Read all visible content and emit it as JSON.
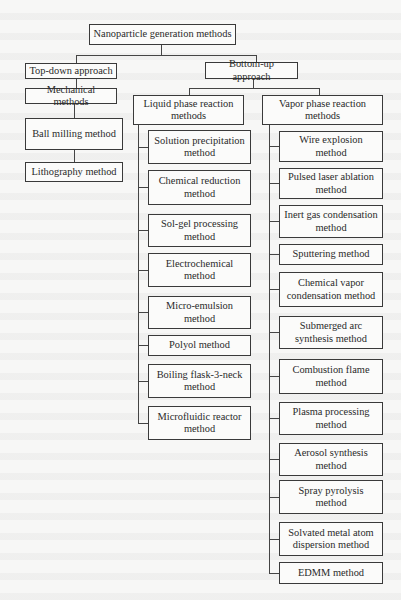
{
  "diagram": {
    "root": "Nanoparticle generation methods",
    "top_down": {
      "label": "Top-down approach",
      "children": [
        "Mechanical methods",
        "Ball milling method",
        "Lithography method"
      ]
    },
    "bottom_up": {
      "label": "Bottom-up approach",
      "liquid": {
        "label": "Liquid phase reaction methods",
        "children": [
          "Solution precipitation method",
          "Chemical reduction method",
          "Sol-gel processing method",
          "Electrochemical method",
          "Micro-emulsion method",
          "Polyol method",
          "Boiling flask-3-neck method",
          "Microfluidic reactor method"
        ]
      },
      "vapor": {
        "label": "Vapor phase reaction methods",
        "children": [
          "Wire explosion method",
          "Pulsed laser ablation method",
          "Inert gas condensation method",
          "Sputtering method",
          "Chemical vapor condensation method",
          "Submerged arc synthesis method",
          "Combustion flame method",
          "Plasma processing method",
          "Aerosol synthesis method",
          "Spray pyrolysis method",
          "Solvated metal atom dispersion method",
          "EDMM method"
        ]
      }
    }
  }
}
